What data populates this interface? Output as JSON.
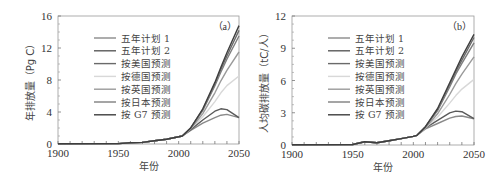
{
  "chart_data": [
    {
      "type": "line",
      "panel_label": "（a）",
      "title": "",
      "xlabel": "年份",
      "ylabel": "年排放量（Pg C）",
      "xlim": [
        1900,
        2050
      ],
      "ylim": [
        0,
        16
      ],
      "xticks": [
        "1900",
        "1950",
        "2000",
        "2050"
      ],
      "yticks": [
        "0",
        "4",
        "8",
        "12",
        "16"
      ],
      "grid": false,
      "legend_position": "upper-left-inside",
      "x": [
        1900,
        1950,
        1960,
        1970,
        1980,
        1990,
        2000,
        2003,
        2010,
        2020,
        2030,
        2035,
        2040,
        2050
      ],
      "series": [
        {
          "name": "五年计划 1",
          "color": "#8a8a8a",
          "values": [
            0.02,
            0.05,
            0.15,
            0.2,
            0.4,
            0.6,
            0.9,
            1.0,
            1.7,
            2.6,
            3.3,
            3.6,
            3.7,
            3.3
          ]
        },
        {
          "name": "五年计划 2",
          "color": "#5a5a5a",
          "values": [
            0.02,
            0.05,
            0.15,
            0.2,
            0.4,
            0.6,
            0.9,
            1.0,
            1.8,
            3.0,
            4.1,
            4.4,
            4.3,
            3.3
          ]
        },
        {
          "name": "按美国预测",
          "color": "#6a6a6a",
          "values": [
            0.02,
            0.05,
            0.15,
            0.2,
            0.4,
            0.6,
            0.9,
            1.0,
            2.0,
            4.3,
            7.5,
            9.3,
            11.0,
            14.2
          ]
        },
        {
          "name": "按德国预测",
          "color": "#d8d8d8",
          "values": [
            0.02,
            0.05,
            0.15,
            0.2,
            0.4,
            0.6,
            0.9,
            1.0,
            1.9,
            3.4,
            5.3,
            6.4,
            7.3,
            8.5
          ]
        },
        {
          "name": "按英国预测",
          "color": "#9a9a9a",
          "values": [
            0.02,
            0.05,
            0.15,
            0.2,
            0.4,
            0.6,
            0.9,
            1.0,
            1.9,
            3.8,
            6.4,
            7.9,
            9.2,
            11.5
          ]
        },
        {
          "name": "按日本预测",
          "color": "#7e7e7e",
          "values": [
            0.02,
            0.05,
            0.15,
            0.2,
            0.4,
            0.6,
            0.9,
            1.0,
            2.0,
            4.2,
            7.3,
            9.0,
            10.6,
            13.5
          ]
        },
        {
          "name": "按 G7 预测",
          "color": "#3e3e3e",
          "values": [
            0.02,
            0.05,
            0.15,
            0.2,
            0.4,
            0.6,
            0.9,
            1.0,
            2.0,
            4.4,
            7.7,
            9.6,
            11.4,
            14.8
          ]
        }
      ]
    },
    {
      "type": "line",
      "panel_label": "（b）",
      "title": "",
      "xlabel": "年份",
      "ylabel": "人均碳排放量（tC/人）",
      "xlim": [
        1900,
        2050
      ],
      "ylim": [
        0,
        12
      ],
      "xticks": [
        "1900",
        "1950",
        "2000",
        "2050"
      ],
      "yticks": [
        "0",
        "3",
        "6",
        "9",
        "12"
      ],
      "grid": false,
      "legend_position": "upper-left-inside",
      "x": [
        1900,
        1950,
        1960,
        1965,
        1970,
        1980,
        1990,
        2000,
        2003,
        2010,
        2020,
        2030,
        2035,
        2040,
        2050
      ],
      "series": [
        {
          "name": "五年计划 1",
          "color": "#8a8a8a",
          "values": [
            0.02,
            0.05,
            0.3,
            0.25,
            0.2,
            0.4,
            0.6,
            0.8,
            0.9,
            1.5,
            2.0,
            2.5,
            2.65,
            2.7,
            2.45
          ]
        },
        {
          "name": "五年计划 2",
          "color": "#5a5a5a",
          "values": [
            0.02,
            0.05,
            0.3,
            0.25,
            0.2,
            0.4,
            0.6,
            0.8,
            0.9,
            1.6,
            2.3,
            3.0,
            3.15,
            3.1,
            2.45
          ]
        },
        {
          "name": "按美国预测",
          "color": "#6a6a6a",
          "values": [
            0.02,
            0.05,
            0.3,
            0.25,
            0.2,
            0.4,
            0.6,
            0.8,
            0.9,
            1.7,
            3.3,
            5.6,
            6.8,
            7.9,
            10.0
          ]
        },
        {
          "name": "按德国预测",
          "color": "#d8d8d8",
          "values": [
            0.02,
            0.05,
            0.3,
            0.25,
            0.2,
            0.4,
            0.6,
            0.8,
            0.9,
            1.6,
            2.6,
            3.9,
            4.6,
            5.2,
            6.1
          ]
        },
        {
          "name": "按英国预测",
          "color": "#9a9a9a",
          "values": [
            0.02,
            0.05,
            0.3,
            0.25,
            0.2,
            0.4,
            0.6,
            0.8,
            0.9,
            1.6,
            2.9,
            4.7,
            5.7,
            6.6,
            8.2
          ]
        },
        {
          "name": "按日本预测",
          "color": "#7e7e7e",
          "values": [
            0.02,
            0.05,
            0.3,
            0.25,
            0.2,
            0.4,
            0.6,
            0.8,
            0.9,
            1.7,
            3.2,
            5.4,
            6.6,
            7.6,
            9.5
          ]
        },
        {
          "name": "按 G7 预测",
          "color": "#3e3e3e",
          "values": [
            0.02,
            0.05,
            0.3,
            0.25,
            0.2,
            0.4,
            0.6,
            0.8,
            0.9,
            1.7,
            3.4,
            5.8,
            7.0,
            8.2,
            10.3
          ]
        }
      ]
    }
  ]
}
